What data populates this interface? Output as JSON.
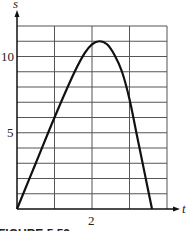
{
  "chart_data": {
    "type": "line",
    "title": "",
    "caption": "FIGURE 5.53",
    "xlabel": "t",
    "ylabel": "s",
    "xlim": [
      0,
      4
    ],
    "ylim": [
      0,
      12
    ],
    "grid": true,
    "x_ticks_labeled": [
      {
        "value": 2,
        "label": "2"
      }
    ],
    "y_ticks_labeled": [
      {
        "value": 5,
        "label": "5"
      },
      {
        "value": 10,
        "label": "10"
      }
    ],
    "series": [
      {
        "name": "s(t)",
        "x": [
          0,
          0.5,
          1,
          1.5,
          1.8,
          2,
          2.2,
          2.4,
          2.6,
          2.8,
          3.0,
          3.2,
          3.4,
          3.6
        ],
        "values": [
          0,
          3.0,
          6.0,
          8.8,
          10.2,
          10.8,
          11.0,
          10.8,
          10.1,
          9.0,
          7.2,
          4.8,
          2.4,
          0
        ]
      }
    ]
  },
  "labels": {
    "y_axis": "s",
    "x_axis": "t",
    "y10": "10",
    "y5": "5",
    "x2": "2",
    "caption": "FIGURE 5.53"
  }
}
